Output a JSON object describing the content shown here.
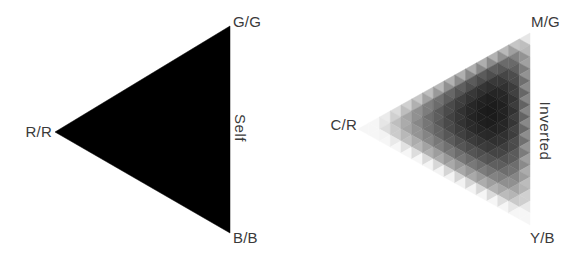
{
  "canvas": {
    "width": 583,
    "height": 263,
    "background": "#ffffff"
  },
  "chart_data": [
    {
      "type": "heatmap",
      "subtype": "ternary_triangle_correlation",
      "title": "Self",
      "side_label": "Self",
      "corner_labels": {
        "left": "R/R",
        "top_right": "G/G",
        "bottom_right": "B/B"
      },
      "uniform_value": 1.0,
      "colors": {
        "min": "#f6f6f6",
        "max": "#000000"
      },
      "vertices_px": {
        "left": [
          55,
          132
        ],
        "top_right": [
          230,
          26
        ],
        "bottom_right": [
          230,
          233
        ]
      },
      "legend": "solid black triangle = maximum self-channel correlation at all points"
    },
    {
      "type": "heatmap",
      "subtype": "ternary_triangle_correlation",
      "title": "Inverted",
      "side_label": "Inverted",
      "corner_labels": {
        "left": "C/R",
        "top_right": "M/G",
        "bottom_right": "Y/B"
      },
      "grid_subdivisions": 16,
      "value_model": {
        "kind": "barycentric_power_product",
        "exponents": {
          "left": 0.65,
          "top_right": 1.35,
          "bottom_right": 0.85
        },
        "gamma": 0.5,
        "floor": 0.18
      },
      "peak_barycentric": {
        "left": 0.23,
        "top_right": 0.47,
        "bottom_right": 0.3
      },
      "peak_px": [
        487,
        116
      ],
      "colors": {
        "min": "#f6f6f6",
        "max": "#1a1a1a"
      },
      "vertices_px": {
        "left": [
          358,
          129
        ],
        "top_right": [
          530,
          33
        ],
        "bottom_right": [
          530,
          225
        ]
      },
      "legend": "grayscale mosaic: near-white at corners/edges, darkest interior cell near right-center"
    }
  ]
}
